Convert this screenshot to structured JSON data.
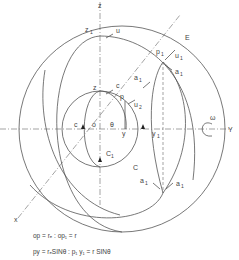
{
  "diagram": {
    "axes": {
      "z_label": "z",
      "y_label": "Y",
      "x_label": "x"
    },
    "points": {
      "z1": "z",
      "z1_sub": "1",
      "z": "z",
      "p": "p",
      "p1": "p",
      "p1_sub": "1",
      "o": "o",
      "c_left": "c",
      "c_center": "c",
      "y": "y",
      "y1": "y",
      "y1_sub": "1",
      "C1": "C",
      "C1_sub": "1",
      "C": "C",
      "theta": "θ"
    },
    "vectors": {
      "u_top": "u",
      "c_top": "c",
      "E": "E",
      "u1": "u",
      "u1_sub": "1",
      "a1_top": "a",
      "a1_top_sub": "1",
      "a1_mid": "a",
      "a1_mid_sub": "1",
      "u2": "u",
      "u2_sub": "2",
      "a_lower_left": "a",
      "a_lower_left_sub": "1",
      "a_lower_right": "a",
      "a_lower_right_sub": "1",
      "omega": "ω"
    },
    "equations": {
      "line1": "op = rₑ : op₁ = r",
      "line2": "py = rₑSINθ : p₁ y₁ = r SINθ"
    }
  }
}
